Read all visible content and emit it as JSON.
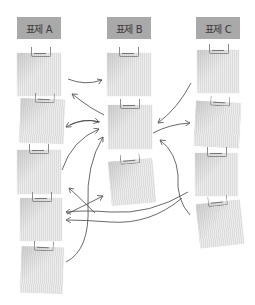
{
  "headers": [
    {
      "label": "표제 A",
      "color": "#a9a9a9"
    },
    {
      "label": "표제 B",
      "color": "#a9a9a9"
    },
    {
      "label": "표제 C",
      "color": "#a9a9a9"
    }
  ],
  "columns": {
    "A": {
      "card_count": 5
    },
    "B": {
      "card_count": 3
    },
    "C": {
      "card_count": 4
    }
  },
  "arrow_color": "#444444",
  "card_color": "#dcdcdc",
  "icons": {
    "clip": "paper-clip-icon",
    "arrow": "curved-arrow-icon"
  }
}
